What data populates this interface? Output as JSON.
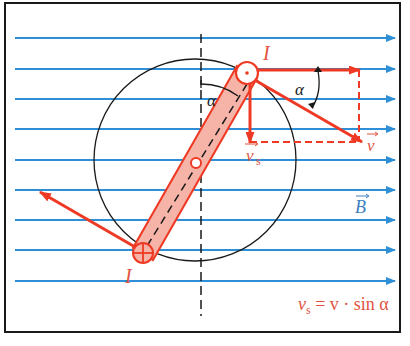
{
  "diagram": {
    "colors": {
      "field": "#2f8fd6",
      "red": "#ee3a24",
      "red_fill": "#f6b3a8",
      "black": "#1a1a1a",
      "label_red": "#e0533f",
      "label_blue": "#3d7fc0"
    },
    "labels": {
      "current_top": "I",
      "current_bottom": "I",
      "angle_left": "α",
      "angle_right": "α",
      "v_s": "v",
      "v_s_sub": "s",
      "v": "v",
      "B": "B",
      "formula_v": "v",
      "formula_sub": "s",
      "formula_rest": " = v · sin α"
    },
    "field_lines_y": [
      38,
      69,
      99,
      129,
      160,
      190,
      220,
      250,
      281
    ],
    "conductor_top": {
      "symbol": "dot",
      "meaning": "current out of page"
    },
    "conductor_bottom": {
      "symbol": "cross",
      "meaning": "current into page"
    }
  }
}
